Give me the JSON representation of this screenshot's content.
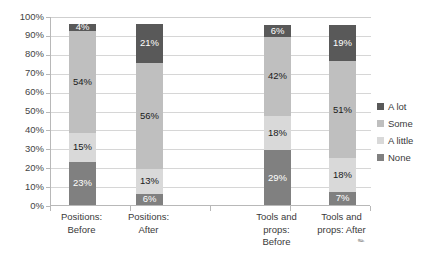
{
  "chart_data": {
    "type": "bar",
    "stacked": true,
    "stacked_percent": true,
    "title": "",
    "xlabel": "",
    "ylabel": "",
    "categories": [
      "Positions: Before",
      "Positions: After",
      "Tools and props: Before",
      "Tools and props: After"
    ],
    "category_label_lines": [
      [
        "Positions:",
        "Before"
      ],
      [
        "Positions:",
        "After"
      ],
      [
        "Tools and",
        "props:",
        "Before"
      ],
      [
        "Tools and",
        "props: After"
      ]
    ],
    "series": [
      {
        "name": "None",
        "color": "#808080",
        "values": [
          23,
          6,
          29,
          7
        ]
      },
      {
        "name": "A little",
        "color": "#d9d9d9",
        "values": [
          15,
          13,
          18,
          18
        ]
      },
      {
        "name": "Some",
        "color": "#bfbfbf",
        "values": [
          54,
          56,
          42,
          51
        ]
      },
      {
        "name": "A lot",
        "color": "#595959",
        "values": [
          4,
          21,
          6,
          19
        ]
      }
    ],
    "data_labels": [
      [
        "23%",
        "15%",
        "54%",
        "4%"
      ],
      [
        "6%",
        "13%",
        "56%",
        "21%"
      ],
      [
        "29%",
        "18%",
        "42%",
        "6%"
      ],
      [
        "7%",
        "18%",
        "51%",
        "19%"
      ]
    ],
    "ylim": [
      0,
      100
    ],
    "yticks": [
      0,
      10,
      20,
      30,
      40,
      50,
      60,
      70,
      80,
      90,
      100
    ],
    "ytick_labels": [
      "0%",
      "10%",
      "20%",
      "30%",
      "40%",
      "50%",
      "60%",
      "70%",
      "80%",
      "90%",
      "100%"
    ],
    "grid": true,
    "legend_position": "right",
    "legend_entries": [
      "A lot",
      "Some",
      "A little",
      "None"
    ]
  },
  "legend": {
    "items": [
      {
        "label": "A lot",
        "color": "#595959"
      },
      {
        "label": "Some",
        "color": "#bfbfbf"
      },
      {
        "label": "A little",
        "color": "#d9d9d9"
      },
      {
        "label": "None",
        "color": "#808080"
      }
    ]
  },
  "colors": {
    "a_lot": "#595959",
    "some": "#bfbfbf",
    "a_little": "#d9d9d9",
    "none": "#808080",
    "gridline": "#d6d6d6",
    "axis": "#b8b8b8",
    "text": "#3a3a3a",
    "label_dark": "#1a1a1a",
    "label_light": "#ffffff",
    "background": "#ffffff"
  },
  "resize_handle": {
    "glyph": "✎"
  }
}
